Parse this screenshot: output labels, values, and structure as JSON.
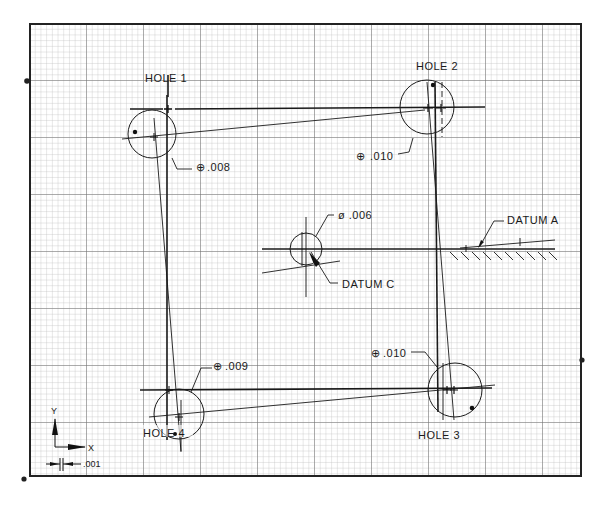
{
  "drawing": {
    "type": "hole-pattern position tolerance plot on graph paper",
    "frame": {
      "x": 30,
      "y": 24,
      "width": 551,
      "height": 452
    },
    "grid": {
      "minor_pitch": 5.7,
      "major_every": 10,
      "minor_color": "#b8b8b8",
      "major_color": "#6a6a6a",
      "frame_color": "#222222"
    },
    "holes": [
      {
        "id": "hole-1",
        "label": "HOLE 1",
        "tolerance": ".008",
        "tolerance_symbol": "position",
        "cx": 150,
        "cy": 134,
        "r": 25
      },
      {
        "id": "hole-2",
        "label": "HOLE 2",
        "tolerance": ".010",
        "tolerance_symbol": "position",
        "cx": 427,
        "cy": 107,
        "r": 27
      },
      {
        "id": "hole-3",
        "label": "HOLE 3",
        "tolerance": ".010",
        "tolerance_symbol": "position",
        "cx": 455,
        "cy": 390,
        "r": 27
      },
      {
        "id": "hole-4",
        "label": "HOLE 4",
        "tolerance": ".009",
        "tolerance_symbol": "position",
        "cx": 179,
        "cy": 414,
        "r": 25
      }
    ],
    "datums": [
      {
        "id": "datum-a",
        "label": "DATUM A"
      },
      {
        "id": "datum-c",
        "label": "DATUM C",
        "tolerance": "ø .006"
      }
    ],
    "labels": {
      "hole1": "HOLE 1",
      "hole2": "HOLE 2",
      "hole3": "HOLE 3",
      "hole4": "HOLE 4",
      "tol1": ".008",
      "tol2": ".010",
      "tol3": ".010",
      "tol4": ".009",
      "tolc": "ø .006",
      "datum_a": "DATUM A",
      "datum_c": "DATUM C",
      "axis_x": "X",
      "axis_y": "Y",
      "scale": ".001"
    },
    "position_symbol": "⊕"
  }
}
